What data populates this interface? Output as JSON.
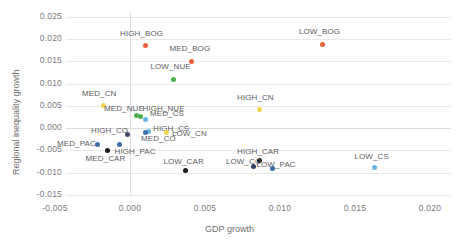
{
  "chart_data": {
    "type": "scatter",
    "title": "",
    "xlabel": "GDP growth",
    "ylabel": "Regional inequality growth",
    "xlim": [
      -0.005,
      0.02
    ],
    "ylim": [
      -0.015,
      0.025
    ],
    "xticks": [
      "-0.005",
      "0.000",
      "0.005",
      "0.010",
      "0.015",
      "0.020"
    ],
    "yticks": [
      "0.025",
      "0.020",
      "0.015",
      "0.010",
      "0.005",
      "0.000",
      "-0.005",
      "-0.010",
      "-0.015"
    ],
    "grid": "horizontal-light-plus-zero-vertical",
    "legend": "none",
    "points": [
      {
        "label": "HIGH_BOG",
        "x": 0.001,
        "y": 0.0185,
        "color": "#e8603c"
      },
      {
        "label": "MED_BOG",
        "x": 0.0041,
        "y": 0.015,
        "color": "#e8603c"
      },
      {
        "label": "LOW_BOG",
        "x": 0.0128,
        "y": 0.0188,
        "color": "#e8603c"
      },
      {
        "label": "LOW_NUE",
        "x": 0.0029,
        "y": 0.011,
        "color": "#4caf50"
      },
      {
        "label": "MED_CN",
        "x": -0.0018,
        "y": 0.005,
        "color": "#f2d64b"
      },
      {
        "label": "HIGH_CN",
        "x": 0.0086,
        "y": 0.0041,
        "color": "#f2d64b"
      },
      {
        "label": "MED_NUE",
        "x": 0.0004,
        "y": 0.0028,
        "color": "#4caf50"
      },
      {
        "label": "HIGH_NUE",
        "x": 0.0007,
        "y": 0.0026,
        "color": "#4caf50"
      },
      {
        "label": "MED_CS",
        "x": 0.001,
        "y": 0.0018,
        "color": "#66b3e8"
      },
      {
        "label": "HIGH_CS",
        "x": 0.0012,
        "y": -0.0008,
        "color": "#66b3e8"
      },
      {
        "label": "LOW_CN",
        "x": 0.0024,
        "y": -0.001,
        "color": "#f2d64b"
      },
      {
        "label": "HIGH_CO",
        "x": -0.0002,
        "y": -0.0014,
        "color": "#4a4a6a"
      },
      {
        "label": "MED_CO",
        "x": 0.001,
        "y": -0.0011,
        "color": "#3f6fa8"
      },
      {
        "label": "MED_PAC",
        "x": -0.0022,
        "y": -0.0036,
        "color": "#3f6fa8"
      },
      {
        "label": "HIGH_PAC",
        "x": -0.0007,
        "y": -0.0037,
        "color": "#3f6fa8"
      },
      {
        "label": "MED_CAR",
        "x": -0.0015,
        "y": -0.005,
        "color": "#1a1a1a"
      },
      {
        "label": "HIGH_CAR",
        "x": 0.0086,
        "y": -0.0073,
        "color": "#1a1a1a"
      },
      {
        "label": "LOW_CO",
        "x": 0.0082,
        "y": -0.0086,
        "color": "#2f3b66"
      },
      {
        "label": "LOW_PAC",
        "x": 0.0095,
        "y": -0.0092,
        "color": "#3f6fa8"
      },
      {
        "label": "LOW_CAR",
        "x": 0.0037,
        "y": -0.0095,
        "color": "#1a1a1a"
      },
      {
        "label": "LOW_CS",
        "x": 0.0163,
        "y": -0.0088,
        "color": "#66b3e8"
      }
    ],
    "label_offsets": [
      {
        "label": "HIGH_BOG",
        "dx": -25,
        "dy": -13
      },
      {
        "label": "MED_BOG",
        "dx": -22,
        "dy": -13
      },
      {
        "label": "LOW_BOG",
        "dx": -23,
        "dy": -13
      },
      {
        "label": "LOW_NUE",
        "dx": -23,
        "dy": -13
      },
      {
        "label": "MED_CN",
        "dx": -21,
        "dy": -13
      },
      {
        "label": "HIGH_CN",
        "dx": -22,
        "dy": -13
      },
      {
        "label": "MED_NUE",
        "dx": -32,
        "dy": -8
      },
      {
        "label": "HIGH_NUE",
        "dx": 2,
        "dy": -8
      },
      {
        "label": "MED_CS",
        "dx": 5,
        "dy": -7
      },
      {
        "label": "HIGH_CS",
        "dx": 5,
        "dy": -4
      },
      {
        "label": "LOW_CN",
        "dx": 6,
        "dy": 1
      },
      {
        "label": "HIGH_CO",
        "dx": -36,
        "dy": -4
      },
      {
        "label": "MED_CO",
        "dx": -4,
        "dy": 5
      },
      {
        "label": "MED_PAC",
        "dx": -40,
        "dy": -1
      },
      {
        "label": "HIGH_PAC",
        "dx": -5,
        "dy": 7
      },
      {
        "label": "MED_CAR",
        "dx": -22,
        "dy": 8
      },
      {
        "label": "HIGH_CAR",
        "dx": -22,
        "dy": -9
      },
      {
        "label": "LOW_CO",
        "dx": -27,
        "dy": -5
      },
      {
        "label": "LOW_PAC",
        "dx": -16,
        "dy": -5
      },
      {
        "label": "LOW_CAR",
        "dx": -22,
        "dy": -9
      },
      {
        "label": "LOW_CS",
        "dx": -20,
        "dy": -11
      }
    ]
  }
}
